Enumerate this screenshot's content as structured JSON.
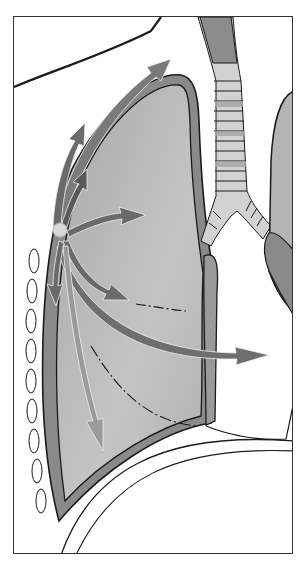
{
  "illustration": {
    "subject": "right lung with radiating arrows from chest wall",
    "colors": {
      "background": "#ffffff",
      "frame": "#333333",
      "lung_fill": "#b4b4b4",
      "lung_fill_light": "#c8c8c8",
      "pleura_band": "#8a8a8a",
      "outline": "#1a1a1a",
      "arrow": "#6a6a6a",
      "arrow_light": "#9a9a9a",
      "trachea_light": "#d2d2d2",
      "trachea_dark": "#8c8c8c",
      "origin_dot": "#d8d8d8"
    },
    "arrows": [
      {
        "name": "arrow-up-long",
        "direction": "up-right"
      },
      {
        "name": "arrow-up-short",
        "direction": "up"
      },
      {
        "name": "arrow-up-inner",
        "direction": "up"
      },
      {
        "name": "arrow-right-upper",
        "direction": "right"
      },
      {
        "name": "arrow-right-middle",
        "direction": "right-down"
      },
      {
        "name": "arrow-right-long",
        "direction": "right"
      },
      {
        "name": "arrow-down-short",
        "direction": "down"
      },
      {
        "name": "arrow-down-long",
        "direction": "down"
      }
    ]
  }
}
